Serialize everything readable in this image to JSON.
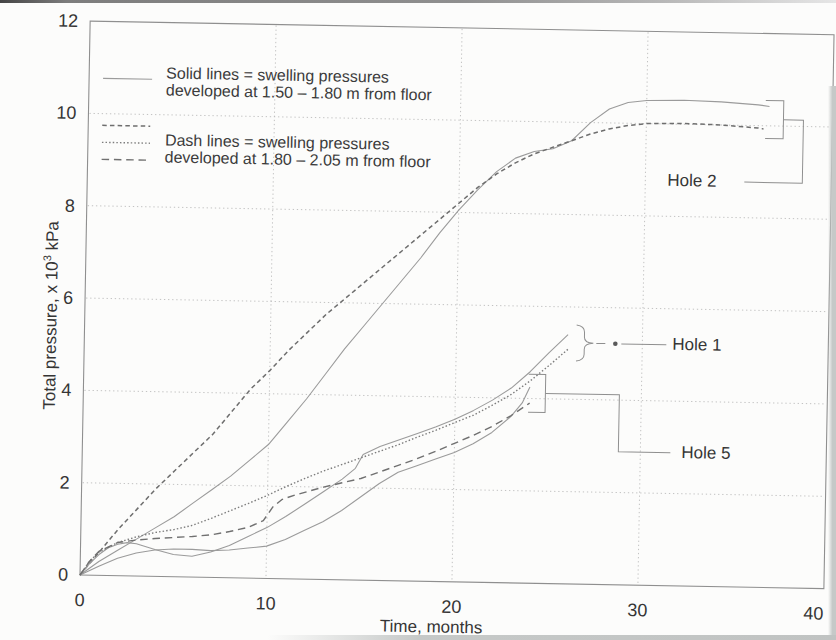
{
  "chart_data": {
    "type": "line",
    "title": "",
    "xlabel": "Time, months",
    "ylabel": "Total pressure, x 10³ kPa",
    "ylabel_parts": {
      "prefix": "Total pressure, x 10",
      "sup": "3",
      "suffix": " kPa"
    },
    "xlim": [
      0,
      40
    ],
    "ylim": [
      0,
      12
    ],
    "x_ticks": [
      0,
      10,
      20,
      30,
      40
    ],
    "y_ticks": [
      0,
      2,
      4,
      6,
      8,
      10,
      12
    ],
    "grid": "fine dotted gridlines at major ticks, both axes",
    "legend_position": "upper-left inside plot area",
    "legend": {
      "solid": {
        "line1": "Solid lines = swelling pressures",
        "line2": "developed at 1.50 – 1.80 m from floor"
      },
      "dash": {
        "line1": "Dash lines = swelling pressures",
        "line2": "developed at 1.80 – 2.05 m from floor"
      }
    },
    "annotations": [
      {
        "label": "Hole 2",
        "series": [
          "hole2-solid",
          "hole2-dash"
        ]
      },
      {
        "label": "Hole 1",
        "series": [
          "hole1-solid",
          "hole1-dash"
        ]
      },
      {
        "label": "Hole 5",
        "series": [
          "hole5-solid",
          "hole5-dash"
        ]
      }
    ],
    "line_styles": {
      "solid": {
        "color": "#9b9b9b",
        "width": 1.1,
        "dash": ""
      },
      "short-dash": {
        "color": "#6e6e6e",
        "width": 1.5,
        "dash": "4.5 3.2"
      },
      "dot": {
        "color": "#7d7d7d",
        "width": 1.4,
        "dash": "1.5 2.1"
      },
      "long-dash": {
        "color": "#707070",
        "width": 1.4,
        "dash": "7.5 4.8"
      }
    },
    "series": [
      {
        "id": "hole2-solid",
        "name": "Hole 2 (solid, 1.50 – 1.80 m)",
        "hole": "Hole 2",
        "depth": "1.50 – 1.80 m from floor",
        "style": "solid",
        "points": [
          [
            0,
            0
          ],
          [
            1,
            0.3
          ],
          [
            2,
            0.55
          ],
          [
            3,
            0.8
          ],
          [
            4,
            1.05
          ],
          [
            5,
            1.3
          ],
          [
            6,
            1.6
          ],
          [
            7,
            1.9
          ],
          [
            8,
            2.2
          ],
          [
            9,
            2.55
          ],
          [
            10,
            2.9
          ],
          [
            11,
            3.4
          ],
          [
            12,
            3.9
          ],
          [
            13,
            4.45
          ],
          [
            14,
            5.0
          ],
          [
            15,
            5.5
          ],
          [
            16,
            6.0
          ],
          [
            17,
            6.5
          ],
          [
            18,
            7.0
          ],
          [
            19,
            7.55
          ],
          [
            20,
            8.05
          ],
          [
            21,
            8.5
          ],
          [
            22,
            8.9
          ],
          [
            23,
            9.2
          ],
          [
            24,
            9.35
          ],
          [
            25,
            9.42
          ],
          [
            26,
            9.6
          ],
          [
            27,
            10.0
          ],
          [
            28,
            10.3
          ],
          [
            29,
            10.45
          ],
          [
            30,
            10.5
          ],
          [
            32,
            10.52
          ],
          [
            34,
            10.5
          ],
          [
            36,
            10.45
          ],
          [
            36.6,
            10.42
          ]
        ]
      },
      {
        "id": "hole2-dash",
        "name": "Hole 2 (dash, 1.80 – 2.05 m)",
        "hole": "Hole 2",
        "depth": "1.80 – 2.05 m from floor",
        "style": "short-dash",
        "points": [
          [
            0,
            0
          ],
          [
            1,
            0.5
          ],
          [
            2,
            1.0
          ],
          [
            3,
            1.45
          ],
          [
            4,
            1.9
          ],
          [
            5,
            2.3
          ],
          [
            6,
            2.7
          ],
          [
            7,
            3.1
          ],
          [
            8,
            3.6
          ],
          [
            9,
            4.1
          ],
          [
            10,
            4.5
          ],
          [
            11,
            4.95
          ],
          [
            12,
            5.35
          ],
          [
            13,
            5.75
          ],
          [
            14,
            6.1
          ],
          [
            15,
            6.45
          ],
          [
            16,
            6.8
          ],
          [
            17,
            7.15
          ],
          [
            18,
            7.5
          ],
          [
            19,
            7.85
          ],
          [
            20,
            8.2
          ],
          [
            21,
            8.55
          ],
          [
            22,
            8.85
          ],
          [
            23,
            9.1
          ],
          [
            24,
            9.3
          ],
          [
            25,
            9.45
          ],
          [
            26,
            9.6
          ],
          [
            27,
            9.75
          ],
          [
            28,
            9.87
          ],
          [
            29,
            9.95
          ],
          [
            30,
            10.0
          ],
          [
            32,
            10.02
          ],
          [
            34,
            10.0
          ],
          [
            36,
            9.95
          ],
          [
            36.3,
            9.93
          ]
        ]
      },
      {
        "id": "hole1-solid",
        "name": "Hole 1 (solid, 1.50 – 1.80 m)",
        "hole": "Hole 1",
        "depth": "1.50 – 1.80 m from floor",
        "style": "solid",
        "points": [
          [
            0,
            0
          ],
          [
            0.5,
            0.25
          ],
          [
            1,
            0.45
          ],
          [
            1.5,
            0.6
          ],
          [
            2,
            0.68
          ],
          [
            2.5,
            0.72
          ],
          [
            3,
            0.7
          ],
          [
            4,
            0.58
          ],
          [
            5,
            0.48
          ],
          [
            6,
            0.45
          ],
          [
            7,
            0.55
          ],
          [
            8,
            0.7
          ],
          [
            9,
            0.9
          ],
          [
            10,
            1.1
          ],
          [
            11,
            1.35
          ],
          [
            12,
            1.62
          ],
          [
            13,
            1.9
          ],
          [
            14,
            2.18
          ],
          [
            14.7,
            2.42
          ],
          [
            15.1,
            2.72
          ],
          [
            16,
            2.9
          ],
          [
            17,
            3.05
          ],
          [
            18,
            3.2
          ],
          [
            19,
            3.35
          ],
          [
            20,
            3.52
          ],
          [
            21,
            3.72
          ],
          [
            22,
            3.95
          ],
          [
            23,
            4.22
          ],
          [
            24,
            4.58
          ],
          [
            25,
            5.0
          ],
          [
            26,
            5.4
          ]
        ]
      },
      {
        "id": "hole1-dash",
        "name": "Hole 1 (dash, 1.80 – 2.05 m)",
        "hole": "Hole 1",
        "depth": "1.80 – 2.05 m from floor",
        "style": "dot",
        "points": [
          [
            0,
            0
          ],
          [
            0.5,
            0.3
          ],
          [
            1,
            0.5
          ],
          [
            2,
            0.72
          ],
          [
            3,
            0.85
          ],
          [
            4,
            0.95
          ],
          [
            5,
            1.02
          ],
          [
            6,
            1.12
          ],
          [
            7,
            1.28
          ],
          [
            8,
            1.45
          ],
          [
            9,
            1.62
          ],
          [
            10,
            1.8
          ],
          [
            11,
            2.0
          ],
          [
            12,
            2.18
          ],
          [
            13,
            2.35
          ],
          [
            14,
            2.5
          ],
          [
            15,
            2.65
          ],
          [
            16,
            2.8
          ],
          [
            17,
            2.95
          ],
          [
            18,
            3.12
          ],
          [
            19,
            3.28
          ],
          [
            20,
            3.45
          ],
          [
            21,
            3.62
          ],
          [
            22,
            3.84
          ],
          [
            23,
            4.08
          ],
          [
            24,
            4.38
          ],
          [
            25,
            4.72
          ],
          [
            26,
            5.08
          ]
        ]
      },
      {
        "id": "hole5-solid",
        "name": "Hole 5 (solid, 1.50 – 1.80 m)",
        "hole": "Hole 5",
        "depth": "1.50 – 1.80 m from floor",
        "style": "solid",
        "points": [
          [
            0,
            0
          ],
          [
            1,
            0.2
          ],
          [
            2,
            0.38
          ],
          [
            3,
            0.5
          ],
          [
            4,
            0.57
          ],
          [
            5,
            0.6
          ],
          [
            6,
            0.6
          ],
          [
            7,
            0.58
          ],
          [
            8,
            0.6
          ],
          [
            9,
            0.65
          ],
          [
            10,
            0.7
          ],
          [
            11,
            0.85
          ],
          [
            12,
            1.05
          ],
          [
            13,
            1.25
          ],
          [
            14,
            1.5
          ],
          [
            15,
            1.8
          ],
          [
            16,
            2.1
          ],
          [
            17,
            2.35
          ],
          [
            18,
            2.5
          ],
          [
            19,
            2.65
          ],
          [
            20,
            2.8
          ],
          [
            21,
            3.0
          ],
          [
            22,
            3.25
          ],
          [
            23,
            3.6
          ],
          [
            23.6,
            3.9
          ],
          [
            24,
            4.25
          ]
        ]
      },
      {
        "id": "hole5-dash",
        "name": "Hole 5 (dash, 1.80 – 2.05 m)",
        "hole": "Hole 5",
        "depth": "1.80 – 2.05 m from floor",
        "style": "long-dash",
        "points": [
          [
            0,
            0
          ],
          [
            0.5,
            0.3
          ],
          [
            1,
            0.52
          ],
          [
            2,
            0.72
          ],
          [
            3,
            0.78
          ],
          [
            4,
            0.82
          ],
          [
            5,
            0.85
          ],
          [
            6,
            0.88
          ],
          [
            7,
            0.92
          ],
          [
            8,
            1.0
          ],
          [
            9,
            1.1
          ],
          [
            9.8,
            1.25
          ],
          [
            10.3,
            1.55
          ],
          [
            10.8,
            1.72
          ],
          [
            11.5,
            1.82
          ],
          [
            12,
            1.88
          ],
          [
            13,
            2.0
          ],
          [
            14,
            2.1
          ],
          [
            15,
            2.2
          ],
          [
            16,
            2.35
          ],
          [
            17,
            2.5
          ],
          [
            18,
            2.65
          ],
          [
            19,
            2.82
          ],
          [
            20,
            3.0
          ],
          [
            21,
            3.18
          ],
          [
            22,
            3.38
          ],
          [
            23,
            3.62
          ],
          [
            24,
            3.9
          ]
        ]
      }
    ]
  }
}
